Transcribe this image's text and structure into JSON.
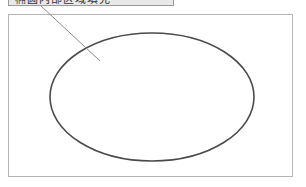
{
  "callout": {
    "label": "椭圆内部区域填充"
  },
  "figure": {
    "frame": {
      "x": 8.5,
      "y": 14.5,
      "width": 284,
      "height": 162,
      "stroke": "#b5b5b5"
    },
    "ellipse": {
      "cx": 152,
      "cy": 97,
      "rx": 102,
      "ry": 64,
      "stroke": "#4a4a4a",
      "stroke_width": 1.6
    },
    "leader_line": {
      "x1": 40,
      "y1": 5,
      "x2": 100,
      "y2": 61,
      "stroke": "#8a8a8a"
    }
  }
}
